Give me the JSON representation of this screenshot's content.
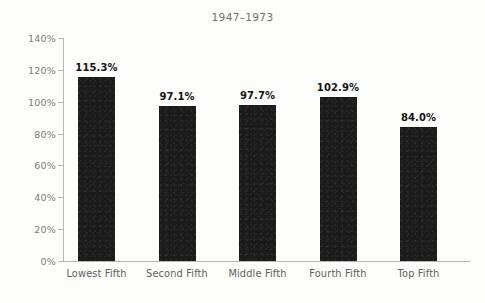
{
  "chart_data": {
    "type": "bar",
    "title": "1947–1973",
    "xlabel": "",
    "ylabel": "",
    "categories": [
      "Lowest Fifth",
      "Second Fifth",
      "Middle Fifth",
      "Fourth Fifth",
      "Top Fifth"
    ],
    "values": [
      115.3,
      97.1,
      97.7,
      102.9,
      84.0
    ],
    "value_labels": [
      "115.3%",
      "97.1%",
      "97.7%",
      "102.9%",
      "84.0%"
    ],
    "ylim": [
      0,
      140
    ],
    "ytick_values": [
      0,
      20,
      40,
      60,
      80,
      100,
      120,
      140
    ],
    "ytick_labels": [
      "0%",
      "20%",
      "40%",
      "60%",
      "80%",
      "100%",
      "120%",
      "140%"
    ],
    "grid": false,
    "legend": false,
    "legend_position": "none",
    "bar_color": "#1b1b1b",
    "axis_color": "#b5b5b2",
    "tick_label_color": "#7b7b7b",
    "title_color": "#6f6f6f",
    "background_color": "#fdfdfb"
  }
}
